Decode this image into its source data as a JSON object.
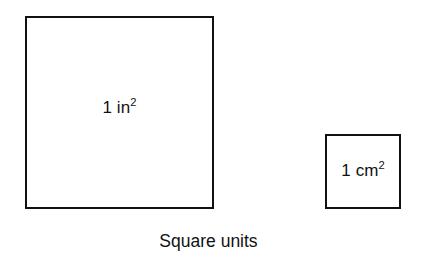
{
  "figure": {
    "caption": "Square units",
    "background_color": "#ffffff",
    "stroke_color": "#111111"
  },
  "shapes": {
    "inch": {
      "label_base": "1 in",
      "label_exponent": "2",
      "label_full": "1 in2",
      "unit": "square inch",
      "x": 25,
      "y": 16,
      "width": 189,
      "height": 193
    },
    "cm": {
      "label_base": "1 cm",
      "label_exponent": "2",
      "label_full": "1 cm2",
      "unit": "square centimeter",
      "x": 325,
      "y": 134,
      "width": 76,
      "height": 75
    }
  },
  "chart_data": {
    "type": "diagram",
    "title": "Square units",
    "items": [
      {
        "name": "1 in2",
        "base": "1 in",
        "exponent": "2",
        "side_px": 189,
        "relative_area": 1.0
      },
      {
        "name": "1 cm2",
        "base": "1 cm",
        "exponent": "2",
        "side_px": 76,
        "relative_area": 0.155
      }
    ]
  }
}
